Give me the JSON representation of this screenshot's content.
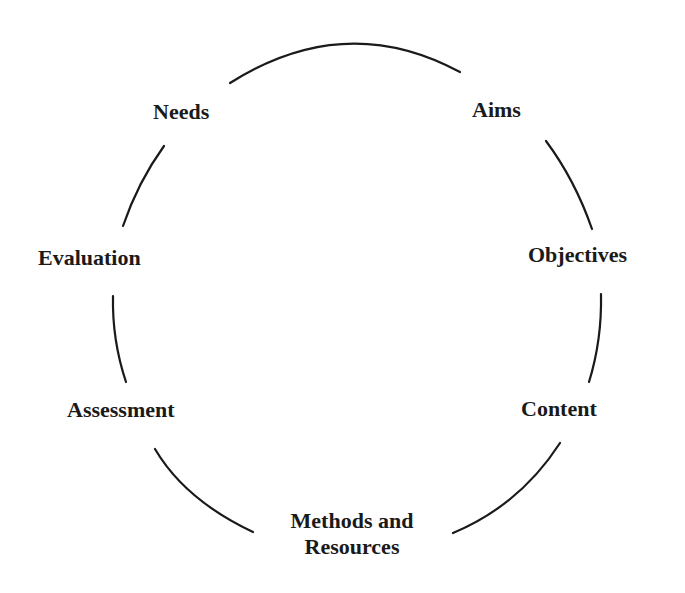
{
  "diagram": {
    "type": "cycle",
    "nodes": [
      {
        "id": "needs",
        "label": "Needs"
      },
      {
        "id": "aims",
        "label": "Aims"
      },
      {
        "id": "objectives",
        "label": "Objectives"
      },
      {
        "id": "content",
        "label": "Content"
      },
      {
        "id": "methods",
        "label_line1": "Methods and",
        "label_line2": "Resources"
      },
      {
        "id": "assessment",
        "label": "Assessment"
      },
      {
        "id": "evaluation",
        "label": "Evaluation"
      }
    ],
    "connector_color": "#1a1a1a"
  }
}
